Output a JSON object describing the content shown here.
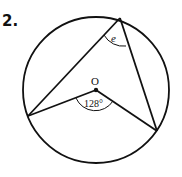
{
  "problem": {
    "number": "2.",
    "center_label": "O",
    "central_angle_label": "128°",
    "inscribed_angle_label": "e"
  }
}
